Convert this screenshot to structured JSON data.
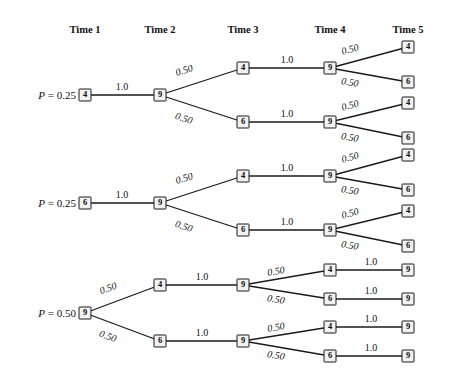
{
  "figure": {
    "type": "transition-tree-diagram",
    "width": 450,
    "height": 382,
    "line_color": "#1a1a1a",
    "node_fill": "#f2f2f2",
    "text_color": "#111111"
  },
  "columns": [
    {
      "label": "Time 1",
      "x": 85
    },
    {
      "label": "Time 2",
      "x": 160
    },
    {
      "label": "Time 3",
      "x": 243
    },
    {
      "label": "Time 4",
      "x": 330
    },
    {
      "label": "Time 5",
      "x": 408
    }
  ],
  "header_y": 24,
  "blocks": [
    {
      "id": "block-1",
      "probability_label": {
        "prefix": "P",
        "equals": " = ",
        "value": "0.25",
        "x": 76,
        "y": 95
      },
      "nodes": [
        {
          "id": "b1-t1",
          "time": 1,
          "value": "4",
          "x": 85,
          "y": 95
        },
        {
          "id": "b1-t2",
          "time": 2,
          "value": "9",
          "x": 160,
          "y": 95
        },
        {
          "id": "b1-t3a",
          "time": 3,
          "value": "4",
          "x": 243,
          "y": 68
        },
        {
          "id": "b1-t3b",
          "time": 3,
          "value": "6",
          "x": 243,
          "y": 122
        },
        {
          "id": "b1-t4a",
          "time": 4,
          "value": "9",
          "x": 330,
          "y": 68
        },
        {
          "id": "b1-t4b",
          "time": 4,
          "value": "9",
          "x": 330,
          "y": 122
        },
        {
          "id": "b1-t5a",
          "time": 5,
          "value": "4",
          "x": 408,
          "y": 47
        },
        {
          "id": "b1-t5b",
          "time": 5,
          "value": "6",
          "x": 408,
          "y": 82
        },
        {
          "id": "b1-t5c",
          "time": 5,
          "value": "4",
          "x": 408,
          "y": 103
        },
        {
          "id": "b1-t5d",
          "time": 5,
          "value": "6",
          "x": 408,
          "y": 138
        }
      ],
      "edges": [
        {
          "from": "b1-t1",
          "to": "b1-t2",
          "label": "1.0",
          "style": "flat",
          "lx": 122,
          "ly": 86
        },
        {
          "from": "b1-t2",
          "to": "b1-t3a",
          "label": "0.50",
          "style": "ital",
          "lx": 184,
          "ly": 70,
          "rot": -18
        },
        {
          "from": "b1-t2",
          "to": "b1-t3b",
          "label": "0.50",
          "style": "ital",
          "lx": 184,
          "ly": 118,
          "rot": 18
        },
        {
          "from": "b1-t3a",
          "to": "b1-t4a",
          "label": "1.0",
          "style": "flat",
          "lx": 287,
          "ly": 59
        },
        {
          "from": "b1-t3b",
          "to": "b1-t4b",
          "label": "1.0",
          "style": "flat",
          "lx": 287,
          "ly": 113
        },
        {
          "from": "b1-t4a",
          "to": "b1-t5a",
          "label": "0.50",
          "style": "ital",
          "lx": 350,
          "ly": 49,
          "rot": -15
        },
        {
          "from": "b1-t4a",
          "to": "b1-t5b",
          "label": "0.50",
          "style": "ital",
          "lx": 350,
          "ly": 82,
          "rot": 10
        },
        {
          "from": "b1-t4b",
          "to": "b1-t5c",
          "label": "0.50",
          "style": "ital",
          "lx": 350,
          "ly": 105,
          "rot": -15
        },
        {
          "from": "b1-t4b",
          "to": "b1-t5d",
          "label": "0.50",
          "style": "ital",
          "lx": 350,
          "ly": 137,
          "rot": 10
        }
      ]
    },
    {
      "id": "block-2",
      "probability_label": {
        "prefix": "P",
        "equals": " = ",
        "value": "0.25",
        "x": 76,
        "y": 203
      },
      "nodes": [
        {
          "id": "b2-t1",
          "time": 1,
          "value": "6",
          "x": 85,
          "y": 203
        },
        {
          "id": "b2-t2",
          "time": 2,
          "value": "9",
          "x": 160,
          "y": 203
        },
        {
          "id": "b2-t3a",
          "time": 3,
          "value": "4",
          "x": 243,
          "y": 176
        },
        {
          "id": "b2-t3b",
          "time": 3,
          "value": "6",
          "x": 243,
          "y": 230
        },
        {
          "id": "b2-t4a",
          "time": 4,
          "value": "9",
          "x": 330,
          "y": 176
        },
        {
          "id": "b2-t4b",
          "time": 4,
          "value": "9",
          "x": 330,
          "y": 230
        },
        {
          "id": "b2-t5a",
          "time": 5,
          "value": "4",
          "x": 408,
          "y": 155
        },
        {
          "id": "b2-t5b",
          "time": 5,
          "value": "6",
          "x": 408,
          "y": 190
        },
        {
          "id": "b2-t5c",
          "time": 5,
          "value": "4",
          "x": 408,
          "y": 211
        },
        {
          "id": "b2-t5d",
          "time": 5,
          "value": "6",
          "x": 408,
          "y": 246
        }
      ],
      "edges": [
        {
          "from": "b2-t1",
          "to": "b2-t2",
          "label": "1.0",
          "style": "flat",
          "lx": 122,
          "ly": 194
        },
        {
          "from": "b2-t2",
          "to": "b2-t3a",
          "label": "0.50",
          "style": "ital",
          "lx": 184,
          "ly": 178,
          "rot": -18
        },
        {
          "from": "b2-t2",
          "to": "b2-t3b",
          "label": "0.50",
          "style": "ital",
          "lx": 184,
          "ly": 226,
          "rot": 18
        },
        {
          "from": "b2-t3a",
          "to": "b2-t4a",
          "label": "1.0",
          "style": "flat",
          "lx": 287,
          "ly": 167
        },
        {
          "from": "b2-t3b",
          "to": "b2-t4b",
          "label": "1.0",
          "style": "flat",
          "lx": 287,
          "ly": 221
        },
        {
          "from": "b2-t4a",
          "to": "b2-t5a",
          "label": "0.50",
          "style": "ital",
          "lx": 350,
          "ly": 157,
          "rot": -15
        },
        {
          "from": "b2-t4a",
          "to": "b2-t5b",
          "label": "0.50",
          "style": "ital",
          "lx": 350,
          "ly": 190,
          "rot": 10
        },
        {
          "from": "b2-t4b",
          "to": "b2-t5c",
          "label": "0.50",
          "style": "ital",
          "lx": 350,
          "ly": 213,
          "rot": -15
        },
        {
          "from": "b2-t4b",
          "to": "b2-t5d",
          "label": "0.50",
          "style": "ital",
          "lx": 350,
          "ly": 245,
          "rot": 10
        }
      ]
    },
    {
      "id": "block-3",
      "probability_label": {
        "prefix": "P",
        "equals": " = ",
        "value": "0.50",
        "x": 76,
        "y": 313
      },
      "nodes": [
        {
          "id": "b3-t1",
          "time": 1,
          "value": "9",
          "x": 85,
          "y": 313
        },
        {
          "id": "b3-t2a",
          "time": 2,
          "value": "4",
          "x": 160,
          "y": 285
        },
        {
          "id": "b3-t2b",
          "time": 2,
          "value": "6",
          "x": 160,
          "y": 341
        },
        {
          "id": "b3-t3a",
          "time": 3,
          "value": "9",
          "x": 243,
          "y": 285
        },
        {
          "id": "b3-t3b",
          "time": 3,
          "value": "9",
          "x": 243,
          "y": 341
        },
        {
          "id": "b3-t4a",
          "time": 4,
          "value": "4",
          "x": 330,
          "y": 270
        },
        {
          "id": "b3-t4b",
          "time": 4,
          "value": "6",
          "x": 330,
          "y": 299
        },
        {
          "id": "b3-t4c",
          "time": 4,
          "value": "4",
          "x": 330,
          "y": 327
        },
        {
          "id": "b3-t4d",
          "time": 4,
          "value": "6",
          "x": 330,
          "y": 356
        },
        {
          "id": "b3-t5a",
          "time": 5,
          "value": "9",
          "x": 408,
          "y": 270
        },
        {
          "id": "b3-t5b",
          "time": 5,
          "value": "9",
          "x": 408,
          "y": 299
        },
        {
          "id": "b3-t5c",
          "time": 5,
          "value": "9",
          "x": 408,
          "y": 327
        },
        {
          "id": "b3-t5d",
          "time": 5,
          "value": "9",
          "x": 408,
          "y": 356
        }
      ],
      "edges": [
        {
          "from": "b3-t1",
          "to": "b3-t2a",
          "label": "0.50",
          "style": "ital",
          "lx": 108,
          "ly": 288,
          "rot": -20
        },
        {
          "from": "b3-t1",
          "to": "b3-t2b",
          "label": "0.50",
          "style": "ital",
          "lx": 108,
          "ly": 336,
          "rot": 20
        },
        {
          "from": "b3-t2a",
          "to": "b3-t3a",
          "label": "1.0",
          "style": "flat",
          "lx": 202,
          "ly": 276
        },
        {
          "from": "b3-t2b",
          "to": "b3-t3b",
          "label": "1.0",
          "style": "flat",
          "lx": 202,
          "ly": 332
        },
        {
          "from": "b3-t3a",
          "to": "b3-t4a",
          "label": "0.50",
          "style": "ital",
          "lx": 276,
          "ly": 271,
          "rot": -11
        },
        {
          "from": "b3-t3a",
          "to": "b3-t4b",
          "label": "0.50",
          "style": "ital",
          "lx": 276,
          "ly": 299,
          "rot": 9
        },
        {
          "from": "b3-t3b",
          "to": "b3-t4c",
          "label": "0.50",
          "style": "ital",
          "lx": 276,
          "ly": 327,
          "rot": -11
        },
        {
          "from": "b3-t3b",
          "to": "b3-t4d",
          "label": "0.50",
          "style": "ital",
          "lx": 276,
          "ly": 355,
          "rot": 9
        },
        {
          "from": "b3-t4a",
          "to": "b3-t5a",
          "label": "1.0",
          "style": "flat",
          "lx": 371,
          "ly": 261
        },
        {
          "from": "b3-t4b",
          "to": "b3-t5b",
          "label": "1.0",
          "style": "flat",
          "lx": 371,
          "ly": 290
        },
        {
          "from": "b3-t4c",
          "to": "b3-t5c",
          "label": "1.0",
          "style": "flat",
          "lx": 371,
          "ly": 318
        },
        {
          "from": "b3-t4d",
          "to": "b3-t5d",
          "label": "1.0",
          "style": "flat",
          "lx": 371,
          "ly": 347
        }
      ]
    }
  ]
}
